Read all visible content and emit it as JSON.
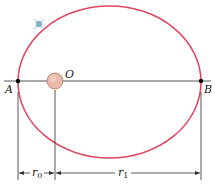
{
  "diagram": {
    "type": "elliptical-orbit",
    "labels": {
      "perihelion": "A",
      "aphelion": "B",
      "focus": "O",
      "r0": "r",
      "r0_sub": "0",
      "r1": "r",
      "r1_sub": "1"
    },
    "colors": {
      "orbit": "#e0485e",
      "axis": "#555555",
      "sun_fill": "#e8b8a8",
      "sun_stroke": "#b07a6a",
      "planet": "#7fb8c8",
      "dimension": "#333333"
    },
    "geometry": {
      "ellipse": {
        "cx": 109.5,
        "cy": 82,
        "rx": 91.5,
        "ry": 76
      },
      "axis_y": 81,
      "point_A_x": 18,
      "point_B_x": 201,
      "focus_x": 55,
      "sun_radius": 8,
      "planet": {
        "x": 39,
        "y": 24
      },
      "dim_y": 173
    }
  }
}
